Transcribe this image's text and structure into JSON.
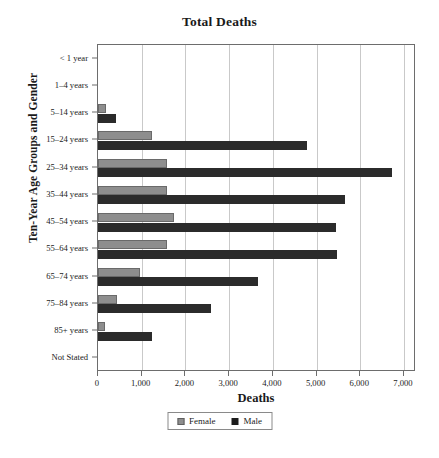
{
  "chart_data": {
    "type": "bar",
    "orientation": "horizontal",
    "title": "Total Deaths",
    "xlabel": "Deaths",
    "ylabel": "Ten-Year Age Groups and Gender",
    "xlim": [
      0,
      7000
    ],
    "xticks": [
      0,
      1000,
      2000,
      3000,
      4000,
      5000,
      6000,
      7000
    ],
    "xtick_labels": [
      "0",
      "1,000",
      "2,000",
      "3,000",
      "4,000",
      "5,000",
      "6,000",
      "7,000"
    ],
    "grid": "vertical",
    "legend_position": "bottom-center",
    "categories": [
      "< 1 year",
      "1–4 years",
      "5–14 years",
      "15–24 years",
      "25–34 years",
      "35–44 years",
      "45–54 years",
      "55–64 years",
      "65–74 years",
      "75–84 years",
      "85+ years",
      "Not Stated"
    ],
    "series": [
      {
        "name": "Female",
        "color": "#8e8e8e",
        "values": [
          0,
          0,
          185,
          1240,
          1580,
          1580,
          1730,
          1580,
          970,
          440,
          155,
          0
        ]
      },
      {
        "name": "Male",
        "color": "#2b2b2b",
        "values": [
          0,
          0,
          420,
          4780,
          6730,
          5640,
          5440,
          5470,
          3670,
          2580,
          1240,
          0
        ]
      }
    ]
  },
  "legend": {
    "entries": [
      {
        "label": "Female",
        "icon": "square-swatch-gray"
      },
      {
        "label": "Male",
        "icon": "square-swatch-black"
      }
    ]
  }
}
